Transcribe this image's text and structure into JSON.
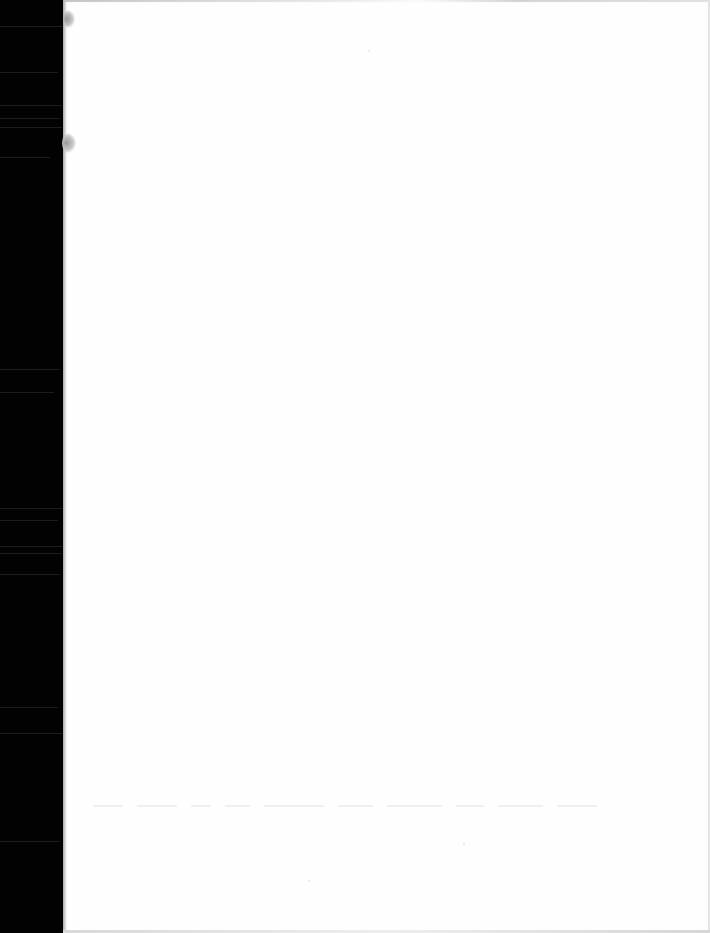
{
  "document": {
    "type": "scanned-page",
    "content_state": "blank",
    "description": "Blank white page with black scanner margin on the left",
    "colors": {
      "scanner_margin": "#020202",
      "page": "#fefefe",
      "punch_hole_shadow": "#9a9a9a",
      "bleed_through": "#f0f0f0"
    },
    "punch_holes": [
      {
        "x": 66,
        "y": 8
      },
      {
        "x": 64,
        "y": 133
      }
    ],
    "bleed_through_text": {
      "legible": false,
      "y": 805,
      "word_widths": [
        30,
        40,
        20,
        25,
        60,
        35,
        55,
        28,
        45,
        40
      ]
    }
  }
}
